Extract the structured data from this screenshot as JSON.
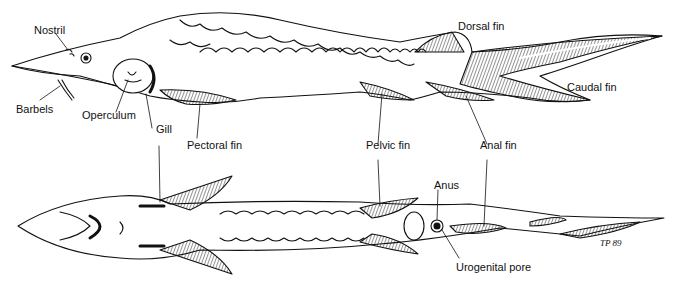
{
  "diagram": {
    "labels": {
      "nostril": "Nostril",
      "barbels": "Barbels",
      "operculum": "Operculum",
      "gill": "Gill",
      "pectoral_fin": "Pectoral fin",
      "dorsal_fin": "Dorsal fin",
      "caudal_fin": "Caudal fin",
      "pelvic_fin": "Pelvic fin",
      "anal_fin": "Anal fin",
      "anus": "Anus",
      "urogenital_pore": "Urogenital pore"
    },
    "signature": "TP 89",
    "colors": {
      "line": "#111111",
      "background": "#ffffff"
    }
  }
}
